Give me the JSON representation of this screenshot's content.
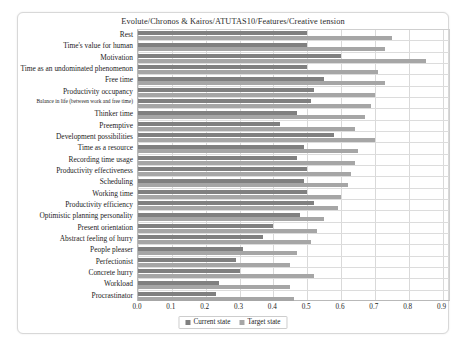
{
  "chart_data": {
    "type": "bar",
    "orientation": "horizontal",
    "title": "Evolute/Chronos & Kairos/ATUTAS10/Features/Creative tension",
    "xlabel": "",
    "ylabel": "",
    "xlim": [
      0.0,
      0.925
    ],
    "xticks": [
      "0.0",
      "0.1",
      "0.2",
      "0.3",
      "0.4",
      "0.5",
      "0.6",
      "0.7",
      "0.8",
      "0.9"
    ],
    "xtick_values": [
      0.0,
      0.1,
      0.2,
      0.3,
      0.4,
      0.5,
      0.6,
      0.7,
      0.8,
      0.9
    ],
    "grid": true,
    "legend_position": "bottom-center",
    "categories": [
      "Rest",
      "Time's value for human",
      "Motivation",
      "Time as an undominated phenomenon",
      "Free time",
      "Productivity occupancy",
      "Balance in life (between work and free time)",
      "Thinker time",
      "Preemptive",
      "Development possibilities",
      "Time as a resource",
      "Recording time usage",
      "Productivity effectiveness",
      "Scheduling",
      "Working time",
      "Productivity efficiency",
      "Optimistic planning personality",
      "Present orientation",
      "Abstract feeling of hurry",
      "People pleaser",
      "Perfectionist",
      "Concrete hurry",
      "Workload",
      "Procrastinator"
    ],
    "series": [
      {
        "name": "Current state",
        "color": "#808080",
        "values": [
          0.5,
          0.5,
          0.6,
          0.5,
          0.55,
          0.52,
          0.51,
          0.47,
          0.42,
          0.58,
          0.49,
          0.47,
          0.5,
          0.49,
          0.5,
          0.52,
          0.48,
          0.4,
          0.37,
          0.31,
          0.29,
          0.3,
          0.24,
          0.23
        ]
      },
      {
        "name": "Target state",
        "color": "#a6a6a6",
        "values": [
          0.75,
          0.73,
          0.85,
          0.71,
          0.73,
          0.7,
          0.69,
          0.67,
          0.64,
          0.7,
          0.65,
          0.64,
          0.63,
          0.62,
          0.6,
          0.59,
          0.55,
          0.53,
          0.51,
          0.47,
          0.45,
          0.52,
          0.45,
          0.46
        ]
      }
    ]
  },
  "legend": {
    "items": [
      {
        "label": "Current state"
      },
      {
        "label": "Target state"
      }
    ]
  }
}
